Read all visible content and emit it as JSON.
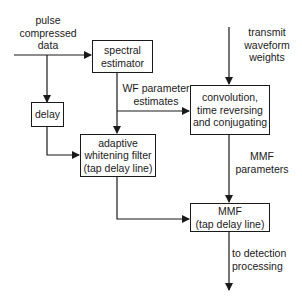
{
  "diagram": {
    "inputs": {
      "pulse_data": "pulse\ncompressed\ndata",
      "transmit_weights": "transmit\nwaveform\nweights"
    },
    "blocks": {
      "spectral_estimator": "spectral\nestimator",
      "delay": "delay",
      "adaptive_whitening_filter": "adaptive\nwhitening filter\n(tap delay line)",
      "convolution": "convolution,\ntime reversing\nand conjugating",
      "mmf": "MMF\n(tap delay line)"
    },
    "edge_labels": {
      "wf_parameter_estimates": "WF parameter\nestimates",
      "mmf_parameters": "MMF\nparameters",
      "output": "to detection\nprocessing"
    },
    "edges": [
      {
        "from": "pulse_data",
        "to": "spectral_estimator"
      },
      {
        "from": "pulse_data",
        "to": "delay"
      },
      {
        "from": "delay",
        "to": "adaptive_whitening_filter"
      },
      {
        "from": "spectral_estimator",
        "to": "adaptive_whitening_filter",
        "label": "WF parameter estimates"
      },
      {
        "from": "spectral_estimator",
        "to": "convolution",
        "label": "WF parameter estimates"
      },
      {
        "from": "transmit_weights",
        "to": "convolution"
      },
      {
        "from": "convolution",
        "to": "mmf",
        "label": "MMF parameters"
      },
      {
        "from": "adaptive_whitening_filter",
        "to": "mmf"
      },
      {
        "from": "mmf",
        "to": "output",
        "label": "to detection processing"
      }
    ]
  }
}
